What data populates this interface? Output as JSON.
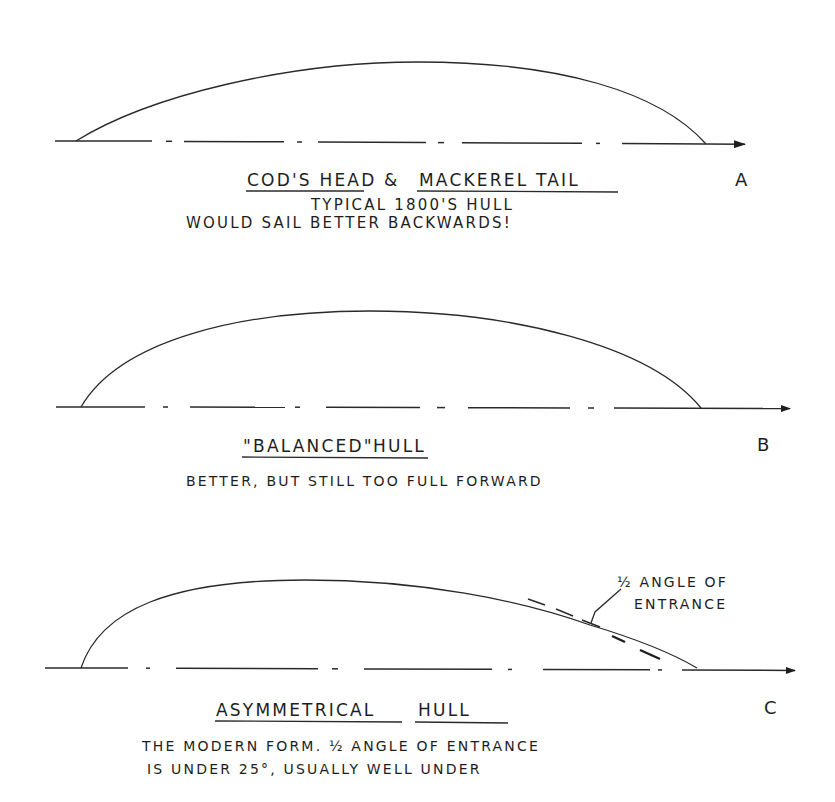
{
  "diagrams": [
    {
      "id": "A",
      "letter": "A",
      "title_part1": "COD'S HEAD",
      "ampersand": "&",
      "title_part2": "MACKEREL TAIL",
      "line1": "TYPICAL 1800'S HULL",
      "line2": "WOULD SAIL BETTER  BACKWARDS!",
      "shape": "full aft, fine forward (max beam near stern)"
    },
    {
      "id": "B",
      "letter": "B",
      "title_quoted": "\"BALANCED\"",
      "title_rest": "HULL",
      "line1": "BETTER, BUT STILL TOO FULL FORWARD",
      "shape": "symmetric"
    },
    {
      "id": "C",
      "letter": "C",
      "title_part1": "ASYMMETRICAL",
      "title_part2": "HULL",
      "line1": "THE MODERN FORM.  ½ ANGLE OF ENTRANCE",
      "line2": "IS UNDER 25°, USUALLY WELL UNDER",
      "annotation_line1": "½ ANGLE OF",
      "annotation_line2": "ENTRANCE",
      "shape": "full forward-of-center max beam, long fine entry"
    }
  ],
  "colors": {
    "background": "#ffffff",
    "ink": "#1e1e1e"
  }
}
